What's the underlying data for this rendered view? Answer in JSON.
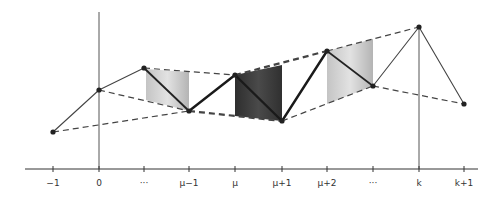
{
  "diagram": {
    "axis": {
      "y": 169,
      "x_start": 25,
      "x_end": 478,
      "color": "#333333"
    },
    "vertical_lines": [
      {
        "name": "y-axis-at-0",
        "x": 99,
        "y_top": 12,
        "y_bottom": 169
      },
      {
        "name": "vertical-at-k",
        "x": 419,
        "y_top": 27,
        "y_bottom": 169
      }
    ],
    "ticks": [
      {
        "label": "−1",
        "x": 53
      },
      {
        "label": "0",
        "x": 99
      },
      {
        "label": "···",
        "x": 144
      },
      {
        "label": "μ−1",
        "x": 189
      },
      {
        "label": "μ",
        "x": 235
      },
      {
        "label": "μ+1",
        "x": 282
      },
      {
        "label": "μ+2",
        "x": 327
      },
      {
        "label": "···",
        "x": 373
      },
      {
        "label": "k",
        "x": 419
      },
      {
        "label": "k+1",
        "x": 464
      }
    ],
    "points": [
      {
        "id": "p-1",
        "x": 53,
        "y": 132
      },
      {
        "id": "p0",
        "x": 99,
        "y": 90
      },
      {
        "id": "p1",
        "x": 144,
        "y": 68
      },
      {
        "id": "pmu-1",
        "x": 189,
        "y": 111
      },
      {
        "id": "pmu",
        "x": 235,
        "y": 75
      },
      {
        "id": "pmu+1",
        "x": 282,
        "y": 121
      },
      {
        "id": "pmu+2",
        "x": 327,
        "y": 51
      },
      {
        "id": "pdots",
        "x": 373,
        "y": 86
      },
      {
        "id": "pk",
        "x": 419,
        "y": 27
      },
      {
        "id": "pk+1",
        "x": 464,
        "y": 104
      }
    ],
    "shaded_regions": [
      {
        "name": "light-shade-left",
        "color": "#b8b8b8",
        "x1": 144,
        "x2": 189
      },
      {
        "name": "dark-shade-middle",
        "color": "#3a3a3a",
        "x1": 235,
        "x2": 282
      },
      {
        "name": "light-shade-right",
        "color": "#bdbdbd",
        "x1": 327,
        "x2": 373
      }
    ],
    "colors": {
      "line": "#444444",
      "bold_line": "#222222",
      "point": "#222222"
    }
  }
}
